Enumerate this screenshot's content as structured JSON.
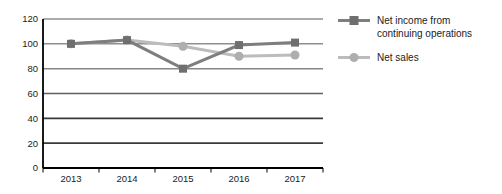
{
  "chart_data": {
    "type": "line",
    "title": "",
    "xlabel": "",
    "ylabel": "",
    "categories": [
      "2013",
      "2014",
      "2015",
      "2016",
      "2017"
    ],
    "series": [
      {
        "name": "Net income from continuing operations",
        "values": [
          100,
          103,
          80,
          99,
          101
        ],
        "color": "#7e7e7e",
        "marker_color": "#6f6f6f",
        "marker": "square"
      },
      {
        "name": "Net sales",
        "values": [
          100,
          103,
          98,
          90,
          91
        ],
        "color": "#bcbcbc",
        "marker_color": "#aeaeae",
        "marker": "circle"
      }
    ],
    "ylim": [
      0,
      120
    ],
    "yticks": [
      0,
      20,
      40,
      60,
      80,
      100,
      120
    ],
    "grid": "horizontal",
    "legend_position": "right",
    "gridline_styles": {
      "20": {
        "color": "#3a3a3a",
        "width": 1.8
      },
      "40": {
        "color": "#3a3a3a",
        "width": 1.8
      },
      "60": {
        "color": "#606060",
        "width": 1.6
      },
      "80": {
        "color": "#878787",
        "width": 1.5
      },
      "100": {
        "color": "#8f8f8f",
        "width": 1.5
      },
      "120": {
        "color": "#8f8f8f",
        "width": 1.5
      }
    },
    "axis_color": "#000000",
    "text_color": "#1c1c1c"
  }
}
